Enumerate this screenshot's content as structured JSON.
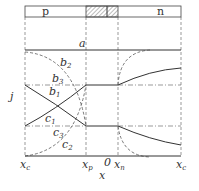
{
  "diagram": {
    "regions": {
      "left": "p",
      "right": "n"
    },
    "axes": {
      "y_label": "j",
      "x_label": "x",
      "x_ticks": [
        {
          "base": "x",
          "sub": "c",
          "pos": "left-edge"
        },
        {
          "base": "x",
          "sub": "p",
          "pos": "depletion-left"
        },
        {
          "base": "0",
          "sub": "",
          "pos": "origin"
        },
        {
          "base": "x",
          "sub": "n",
          "pos": "depletion-right"
        },
        {
          "base": "x",
          "sub": "c",
          "pos": "right-edge"
        }
      ]
    },
    "curves": [
      {
        "label": "a",
        "style": "solid",
        "description": "total current, constant"
      },
      {
        "label": "b",
        "sub": "1",
        "style": "solid"
      },
      {
        "label": "b",
        "sub": "2",
        "style": "dashed"
      },
      {
        "label": "b",
        "sub": "3",
        "style": "dash-dot"
      },
      {
        "label": "c",
        "sub": "1",
        "style": "solid"
      },
      {
        "label": "c",
        "sub": "2",
        "style": "dashed"
      },
      {
        "label": "c",
        "sub": "3",
        "style": "dash-dot"
      }
    ],
    "colors": {
      "line": "#333333",
      "hatch": "#888888",
      "background": "#ffffff"
    }
  }
}
